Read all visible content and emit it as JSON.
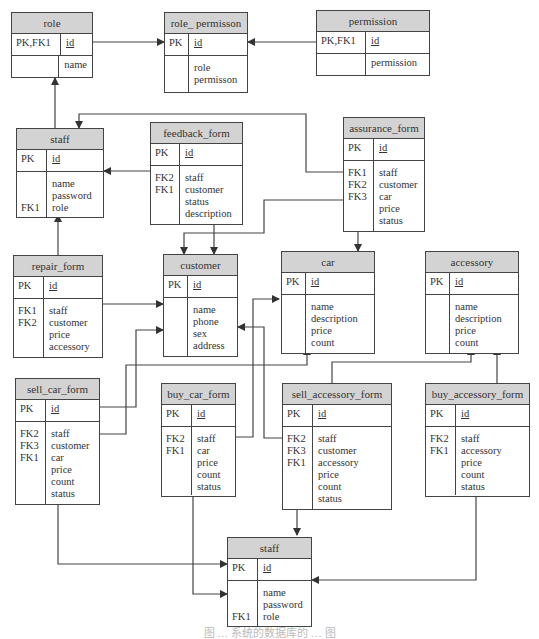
{
  "diagram": {
    "type": "entity-relationship",
    "caption": "图 … 系统的数据库的 … 图",
    "tables": {
      "role": {
        "title": "role",
        "pk_key": "PK,FK1",
        "pk_field": "id",
        "keys": "",
        "fields": "name"
      },
      "role_permission": {
        "title": "role_ permisson",
        "pk_key": "PK",
        "pk_field": "id",
        "keys": "",
        "fields": "role\npermisson"
      },
      "permission": {
        "title": "permission",
        "pk_key": "PK,FK1",
        "pk_field": "id",
        "keys": "",
        "fields": "permission"
      },
      "staff_top": {
        "title": "staff",
        "pk_key": "PK",
        "pk_field": "id",
        "keys": "\n\nFK1",
        "fields": "name\npassword\nrole"
      },
      "feedback_form": {
        "title": "feedback_form",
        "pk_key": "PK",
        "pk_field": "id",
        "keys": "FK2\nFK1",
        "fields": "staff\ncustomer\nstatus\ndescription"
      },
      "assurance_form": {
        "title": "assurance_form",
        "pk_key": "PK",
        "pk_field": "id",
        "keys": "FK1\nFK2\nFK3",
        "fields": "staff\ncustomer\ncar\nprice\nstatus"
      },
      "repair_form": {
        "title": "repair_form",
        "pk_key": "PK",
        "pk_field": "id",
        "keys": "FK1\nFK2",
        "fields": "staff\ncustomer\nprice\naccessory"
      },
      "customer": {
        "title": "customer",
        "pk_key": "PK",
        "pk_field": "id",
        "keys": "",
        "fields": "name\nphone\nsex\naddress"
      },
      "car": {
        "title": "car",
        "pk_key": "PK",
        "pk_field": "id",
        "keys": "",
        "fields": "name\ndescription\nprice\ncount"
      },
      "accessory": {
        "title": "accessory",
        "pk_key": "PK",
        "pk_field": "id",
        "keys": "",
        "fields": "name\ndescription\nprice\ncount"
      },
      "sell_car_form": {
        "title": "sell_car_form",
        "pk_key": "PK",
        "pk_field": "id",
        "keys": "FK2\nFK3\nFK1",
        "fields": "staff\ncustomer\ncar\nprice\ncount\nstatus"
      },
      "buy_car_form": {
        "title": "buy_car_form",
        "pk_key": "PK",
        "pk_field": "id",
        "keys": "FK2\nFK1",
        "fields": "staff\ncar\nprice\ncount\nstatus"
      },
      "sell_accessory_form": {
        "title": "sell_accessory_form",
        "pk_key": "PK",
        "pk_field": "id",
        "keys": "FK2\nFK3\nFK1",
        "fields": "staff\ncustomer\naccessory\nprice\ncount\nstatus"
      },
      "buy_accessory_form": {
        "title": "buy_accessory_form",
        "pk_key": "PK",
        "pk_field": "id",
        "keys": "FK2\nFK1",
        "fields": "staff\naccessory\nprice\ncount\nstatus"
      },
      "staff_bottom": {
        "title": "staff",
        "pk_key": "PK",
        "pk_field": "id",
        "keys": "\n\nFK1",
        "fields": "name\npassword\nrole"
      }
    },
    "relationships": [
      {
        "from": "role",
        "to": "role_permission"
      },
      {
        "from": "permission",
        "to": "role_permission"
      },
      {
        "from": "staff_top",
        "to": "role"
      },
      {
        "from": "feedback_form",
        "to": "staff_top"
      },
      {
        "from": "feedback_form",
        "to": "customer"
      },
      {
        "from": "assurance_form",
        "to": "staff_top"
      },
      {
        "from": "assurance_form",
        "to": "customer"
      },
      {
        "from": "assurance_form",
        "to": "car"
      },
      {
        "from": "repair_form",
        "to": "staff_top"
      },
      {
        "from": "repair_form",
        "to": "customer"
      },
      {
        "from": "sell_car_form",
        "to": "customer"
      },
      {
        "from": "sell_car_form",
        "to": "car"
      },
      {
        "from": "sell_car_form",
        "to": "staff_bottom"
      },
      {
        "from": "buy_car_form",
        "to": "staff_bottom"
      },
      {
        "from": "sell_accessory_form",
        "to": "customer"
      },
      {
        "from": "sell_accessory_form",
        "to": "accessory"
      },
      {
        "from": "sell_accessory_form",
        "to": "staff_bottom"
      },
      {
        "from": "buy_accessory_form",
        "to": "accessory"
      },
      {
        "from": "buy_accessory_form",
        "to": "staff_bottom"
      }
    ]
  }
}
